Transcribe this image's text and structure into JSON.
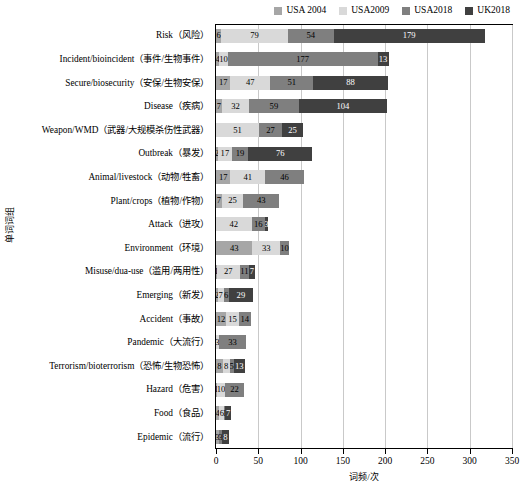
{
  "chart_data": {
    "type": "bar",
    "subtype": "horizontal-stacked",
    "title": "",
    "xlabel": "词频/次",
    "ylabel": "单词词组",
    "xlim": [
      0,
      350
    ],
    "xticks": [
      0,
      50,
      100,
      150,
      200,
      250,
      300,
      350
    ],
    "grid": true,
    "legend_position": "top-right",
    "legend": [
      "USA 2004",
      "USA2009",
      "USA2018",
      "UK2018"
    ],
    "colors": {
      "USA 2004": "#a6a6a6",
      "USA2009": "#d9d9d9",
      "USA2018": "#7f7f7f",
      "UK2018": "#404040"
    },
    "categories": [
      "Risk（风险）",
      "Incident/bioincident（事件/生物事件）",
      "Secure/biosecurity（安保/生物安保）",
      "Disease（疾病）",
      "Weapon/WMD（武器/大规模杀伤性武器）",
      "Outbreak（暴发）",
      "Animal/livestock（动物/牲畜）",
      "Plant/crops（植物/作物）",
      "Attack（进攻）",
      "Environment（环境）",
      "Misuse/dua-use（滥用/两用性）",
      "Emerging（新发）",
      "Accident（事故）",
      "Pandemic（大流行）",
      "Terrorism/bioterrorism（恐怖/生物恐怖）",
      "Hazard（危害）",
      "Food（食品）",
      "Epidemic（流行）"
    ],
    "series": [
      {
        "name": "USA 2004",
        "values": [
          6,
          4,
          17,
          7,
          0,
          2,
          17,
          7,
          0,
          43,
          1,
          2,
          12,
          0,
          8,
          1,
          4,
          3
        ]
      },
      {
        "name": "USA2009",
        "values": [
          79,
          10,
          47,
          32,
          51,
          17,
          41,
          25,
          42,
          33,
          27,
          7,
          15,
          3,
          8,
          10,
          6,
          1
        ]
      },
      {
        "name": "USA2018",
        "values": [
          54,
          177,
          51,
          59,
          27,
          19,
          46,
          43,
          16,
          10,
          11,
          6,
          14,
          33,
          5,
          22,
          1,
          3
        ]
      },
      {
        "name": "UK2018",
        "values": [
          179,
          13,
          88,
          104,
          25,
          76,
          0,
          0,
          3,
          0,
          7,
          29,
          0,
          0,
          13,
          0,
          7,
          8
        ]
      }
    ]
  }
}
